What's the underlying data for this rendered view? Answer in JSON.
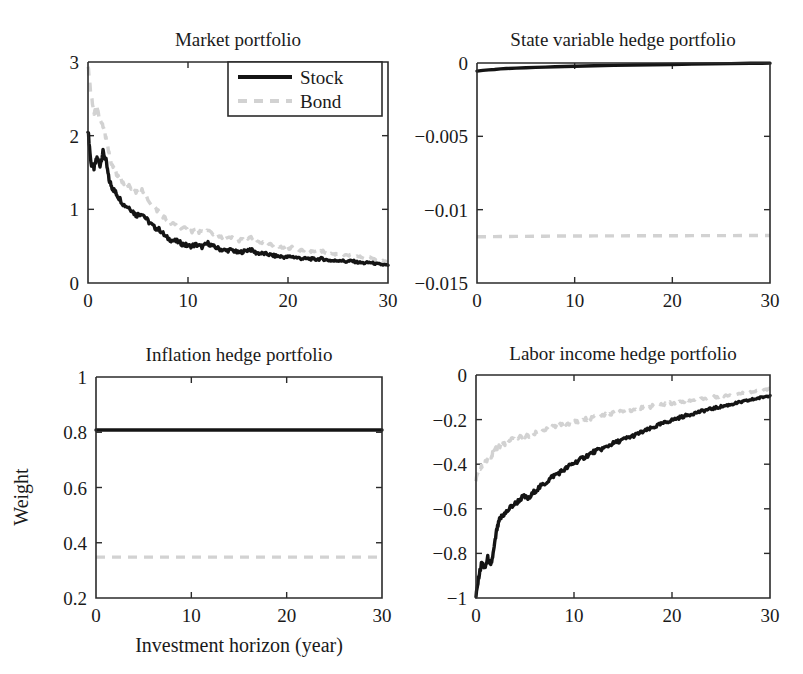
{
  "figure": {
    "xlabel": "Investment horizon (year)",
    "ylabel": "Weight",
    "legend": {
      "position": "top-right of panel 1",
      "entries": [
        {
          "label": "Stock",
          "style": "solid",
          "color": "#141414"
        },
        {
          "label": "Bond",
          "style": "dashed",
          "color": "#d2d2d2"
        }
      ]
    }
  },
  "chart_data": [
    {
      "type": "line",
      "title": "Market portfolio",
      "xlabel": "Investment horizon (year)",
      "ylabel": "Weight",
      "xlim": [
        0,
        30
      ],
      "ylim": [
        0,
        3
      ],
      "xticks": [
        0,
        10,
        20,
        30
      ],
      "yticks": [
        0,
        1,
        2,
        3
      ],
      "xticklabels": [
        "0",
        "10",
        "20",
        "30"
      ],
      "yticklabels": [
        "0",
        "1",
        "2",
        "3"
      ],
      "grid": false,
      "x": [
        0,
        0.3,
        0.6,
        0.9,
        1.2,
        1.5,
        1.8,
        2.1,
        2.4,
        2.7,
        3,
        3.6,
        4.2,
        4.8,
        5.4,
        6,
        6.6,
        7.2,
        7.8,
        8.4,
        9,
        9.6,
        10.2,
        10.8,
        11.4,
        12,
        12.6,
        13.2,
        13.8,
        14.4,
        15,
        15.6,
        16.2,
        16.8,
        17.4,
        18,
        18.6,
        19.2,
        19.8,
        20.4,
        21,
        21.6,
        22.2,
        22.8,
        23.4,
        24,
        24.6,
        25.2,
        25.8,
        26.4,
        27,
        27.6,
        28.2,
        28.8,
        29.4,
        30
      ],
      "series": [
        {
          "name": "Stock",
          "style": "solid",
          "color": "#141414",
          "values": [
            2.08,
            1.62,
            1.56,
            1.7,
            1.6,
            1.78,
            1.66,
            1.4,
            1.3,
            1.24,
            1.18,
            1.06,
            1.02,
            0.92,
            0.95,
            0.84,
            0.76,
            0.72,
            0.62,
            0.58,
            0.56,
            0.52,
            0.5,
            0.52,
            0.49,
            0.54,
            0.49,
            0.46,
            0.44,
            0.45,
            0.41,
            0.43,
            0.46,
            0.41,
            0.4,
            0.39,
            0.37,
            0.36,
            0.35,
            0.36,
            0.34,
            0.33,
            0.33,
            0.32,
            0.33,
            0.31,
            0.3,
            0.31,
            0.29,
            0.3,
            0.28,
            0.27,
            0.28,
            0.26,
            0.25,
            0.24
          ]
        },
        {
          "name": "Bond",
          "style": "dashed",
          "color": "#d2d2d2",
          "values": [
            2.95,
            2.55,
            2.3,
            2.36,
            2.2,
            2.12,
            1.95,
            1.76,
            1.6,
            1.52,
            1.44,
            1.36,
            1.3,
            1.22,
            1.26,
            1.14,
            1.02,
            0.96,
            0.86,
            0.8,
            0.78,
            0.74,
            0.7,
            0.72,
            0.68,
            0.71,
            0.66,
            0.62,
            0.6,
            0.61,
            0.58,
            0.59,
            0.62,
            0.57,
            0.55,
            0.53,
            0.5,
            0.49,
            0.47,
            0.48,
            0.46,
            0.44,
            0.44,
            0.42,
            0.43,
            0.41,
            0.39,
            0.4,
            0.37,
            0.38,
            0.36,
            0.34,
            0.35,
            0.32,
            0.3,
            0.28
          ]
        }
      ]
    },
    {
      "type": "line",
      "title": "State variable hedge portfolio",
      "xlabel": "Investment horizon (year)",
      "ylabel": "Weight",
      "xlim": [
        0,
        30
      ],
      "ylim": [
        -0.015,
        0
      ],
      "xticks": [
        0,
        10,
        20,
        30
      ],
      "yticks": [
        -0.015,
        -0.01,
        -0.005,
        0
      ],
      "xticklabels": [
        "0",
        "10",
        "20",
        "30"
      ],
      "yticklabels": [
        "−0.015",
        "−0.01",
        "−0.005",
        "0"
      ],
      "grid": false,
      "x": [
        0,
        0.6,
        1.2,
        1.8,
        2.4,
        3,
        4,
        5,
        6,
        7,
        8,
        9,
        10,
        12,
        14,
        16,
        18,
        20,
        22,
        24,
        26,
        28,
        30
      ],
      "series": [
        {
          "name": "Stock",
          "style": "solid",
          "color": "#141414",
          "values": [
            -0.00055,
            -0.0005,
            -0.00047,
            -0.00044,
            -0.0004,
            -0.00038,
            -0.00035,
            -0.00032,
            -0.0003,
            -0.00028,
            -0.00026,
            -0.00024,
            -0.00022,
            -0.00019,
            -0.00016,
            -0.00014,
            -0.00012,
            -0.0001,
            -8e-05,
            -6e-05,
            -4e-05,
            -2e-05,
            -1e-05
          ]
        },
        {
          "name": "Bond",
          "style": "dashed",
          "color": "#d2d2d2",
          "values": [
            -0.01185,
            -0.01185,
            -0.01184,
            -0.01184,
            -0.01183,
            -0.01183,
            -0.01182,
            -0.01182,
            -0.01181,
            -0.01181,
            -0.0118,
            -0.0118,
            -0.0118,
            -0.01179,
            -0.01179,
            -0.01178,
            -0.01178,
            -0.01178,
            -0.01177,
            -0.01177,
            -0.01177,
            -0.01176,
            -0.01176
          ]
        }
      ]
    },
    {
      "type": "line",
      "title": "Inflation hedge portfolio",
      "xlabel": "Investment horizon (year)",
      "ylabel": "Weight",
      "xlim": [
        0,
        30
      ],
      "ylim": [
        0.2,
        1
      ],
      "xticks": [
        0,
        10,
        20,
        30
      ],
      "yticks": [
        0.2,
        0.4,
        0.6,
        0.8,
        1
      ],
      "xticklabels": [
        "0",
        "10",
        "20",
        "30"
      ],
      "yticklabels": [
        "0.2",
        "0.4",
        "0.6",
        "0.8",
        "1"
      ],
      "grid": false,
      "x": [
        0,
        5,
        10,
        15,
        20,
        25,
        30
      ],
      "series": [
        {
          "name": "Stock",
          "style": "solid",
          "color": "#141414",
          "values": [
            0.808,
            0.808,
            0.808,
            0.808,
            0.808,
            0.808,
            0.808
          ]
        },
        {
          "name": "Bond",
          "style": "dashed",
          "color": "#d2d2d2",
          "values": [
            0.348,
            0.348,
            0.348,
            0.348,
            0.348,
            0.348,
            0.348
          ]
        }
      ]
    },
    {
      "type": "line",
      "title": "Labor income hedge portfolio",
      "xlabel": "Investment horizon (year)",
      "ylabel": "Weight",
      "xlim": [
        0,
        30
      ],
      "ylim": [
        -1,
        0
      ],
      "xticks": [
        0,
        10,
        20,
        30
      ],
      "yticks": [
        -1,
        -0.8,
        -0.6,
        -0.4,
        -0.2,
        0
      ],
      "xticklabels": [
        "0",
        "10",
        "20",
        "30"
      ],
      "yticklabels": [
        "−1",
        "−0.8",
        "−0.6",
        "−0.4",
        "−0.2",
        "0"
      ],
      "grid": false,
      "x": [
        0,
        0.3,
        0.6,
        0.9,
        1.2,
        1.5,
        1.8,
        2.1,
        2.4,
        2.7,
        3,
        3.6,
        4.2,
        4.8,
        5.4,
        6,
        6.6,
        7.2,
        7.8,
        8.4,
        9,
        9.6,
        10.2,
        10.8,
        11.4,
        12,
        12.6,
        13.2,
        13.8,
        14.4,
        15,
        15.6,
        16.2,
        16.8,
        17.4,
        18,
        18.6,
        19.2,
        19.8,
        20.4,
        21,
        21.6,
        22.2,
        22.8,
        23.4,
        24,
        24.6,
        25.2,
        25.8,
        26.4,
        27,
        27.6,
        28.2,
        28.8,
        29.4,
        30
      ],
      "series": [
        {
          "name": "Stock",
          "style": "solid",
          "color": "#141414",
          "values": [
            -0.995,
            -0.9,
            -0.84,
            -0.87,
            -0.82,
            -0.86,
            -0.79,
            -0.7,
            -0.65,
            -0.63,
            -0.62,
            -0.59,
            -0.57,
            -0.545,
            -0.555,
            -0.52,
            -0.5,
            -0.48,
            -0.455,
            -0.44,
            -0.425,
            -0.405,
            -0.39,
            -0.375,
            -0.36,
            -0.345,
            -0.335,
            -0.325,
            -0.31,
            -0.3,
            -0.29,
            -0.28,
            -0.27,
            -0.258,
            -0.248,
            -0.237,
            -0.225,
            -0.215,
            -0.205,
            -0.196,
            -0.188,
            -0.18,
            -0.172,
            -0.165,
            -0.158,
            -0.152,
            -0.146,
            -0.14,
            -0.134,
            -0.128,
            -0.122,
            -0.116,
            -0.11,
            -0.104,
            -0.098,
            -0.092
          ]
        },
        {
          "name": "Bond",
          "style": "dashed",
          "color": "#d2d2d2",
          "values": [
            -0.47,
            -0.435,
            -0.41,
            -0.398,
            -0.375,
            -0.365,
            -0.348,
            -0.33,
            -0.318,
            -0.312,
            -0.305,
            -0.292,
            -0.285,
            -0.272,
            -0.276,
            -0.262,
            -0.252,
            -0.244,
            -0.234,
            -0.228,
            -0.222,
            -0.214,
            -0.208,
            -0.202,
            -0.196,
            -0.19,
            -0.184,
            -0.179,
            -0.174,
            -0.169,
            -0.164,
            -0.159,
            -0.154,
            -0.149,
            -0.145,
            -0.14,
            -0.136,
            -0.131,
            -0.127,
            -0.123,
            -0.119,
            -0.115,
            -0.111,
            -0.108,
            -0.104,
            -0.1,
            -0.097,
            -0.093,
            -0.09,
            -0.086,
            -0.083,
            -0.079,
            -0.076,
            -0.072,
            -0.068,
            -0.062
          ]
        }
      ]
    }
  ]
}
